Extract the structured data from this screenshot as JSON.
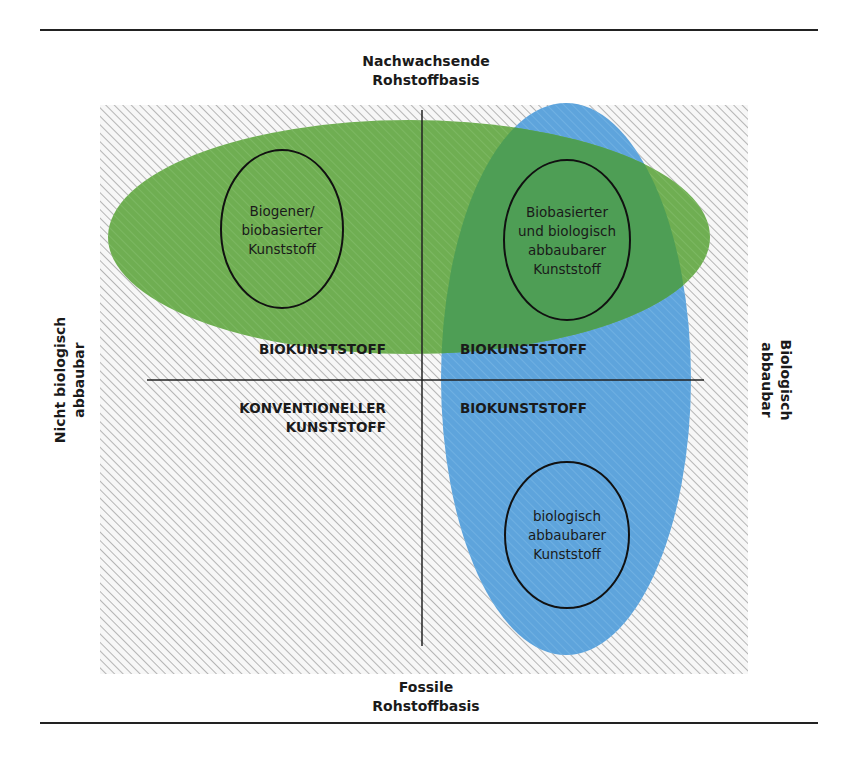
{
  "diagram": {
    "title_axes": {
      "top": [
        "Nachwachsende",
        "Rohstoffbasis"
      ],
      "bottom": [
        "Fossile",
        "Rohstoffbasis"
      ],
      "left": [
        "Nicht biologisch",
        "abbaubar"
      ],
      "right": [
        "Biologisch",
        "abbaubar"
      ]
    },
    "quadrants": {
      "top_left": "BIOKUNSTSTOFF",
      "top_right": "BIOKUNSTSTOFF",
      "bottom_left": [
        "KONVENTIONELLER",
        "KUNSTSTOFF"
      ],
      "bottom_right": "BIOKUNSTSTOFF"
    },
    "sets": {
      "green": {
        "meaning": "Nachwachsende Rohstoffbasis (biobasiert)",
        "color": "#6aaa4e"
      },
      "blue": {
        "meaning": "Biologisch abbaubar",
        "color": "#5fa5dc"
      }
    },
    "inner_ellipses": {
      "left": [
        "Biogener/",
        "biobasierter",
        "Kunststoff"
      ],
      "right": [
        "Biobasierter",
        "und biologisch",
        "abbaubarer",
        "Kunststoff"
      ],
      "bottom": [
        "biologisch",
        "abbaubarer",
        "Kunststoff"
      ]
    },
    "colors": {
      "hatch_bg": "#f4f4f4",
      "hatch_line": "#b8b8b8",
      "overlap": "#4e9e55",
      "axis_line": "#222222"
    }
  }
}
